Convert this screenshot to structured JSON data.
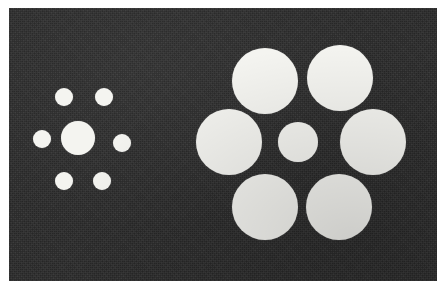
{
  "figure": {
    "name": "ebbinghaus-illusion",
    "canvas": {
      "width": 446,
      "height": 289
    },
    "background_color": "#ffffff",
    "panel": {
      "x": 9,
      "y": 8,
      "width": 428,
      "height": 273,
      "fill_color": "#2b2b2b",
      "texture": "grainy-halftone"
    },
    "circle_color": "#f4f4f0"
  },
  "clusters": [
    {
      "id": "left-cluster",
      "label": "small-inducers",
      "center_target": {
        "cx": 78,
        "cy": 138,
        "d": 34
      },
      "inducer_diameter": 18,
      "inducer_count": 6,
      "inducers": [
        {
          "cx": 64,
          "cy": 97,
          "d": 18
        },
        {
          "cx": 104,
          "cy": 97,
          "d": 18
        },
        {
          "cx": 42,
          "cy": 139,
          "d": 18
        },
        {
          "cx": 122,
          "cy": 143,
          "d": 18
        },
        {
          "cx": 64,
          "cy": 181,
          "d": 18
        },
        {
          "cx": 102,
          "cy": 181,
          "d": 18
        }
      ]
    },
    {
      "id": "right-cluster",
      "label": "large-inducers",
      "center_target": {
        "cx": 298,
        "cy": 142,
        "d": 40
      },
      "inducer_diameter": 66,
      "inducer_count": 6,
      "inducers": [
        {
          "cx": 265,
          "cy": 81,
          "d": 66
        },
        {
          "cx": 340,
          "cy": 78,
          "d": 66
        },
        {
          "cx": 229,
          "cy": 142,
          "d": 66
        },
        {
          "cx": 373,
          "cy": 142,
          "d": 66
        },
        {
          "cx": 265,
          "cy": 207,
          "d": 66
        },
        {
          "cx": 339,
          "cy": 207,
          "d": 66
        }
      ]
    }
  ]
}
